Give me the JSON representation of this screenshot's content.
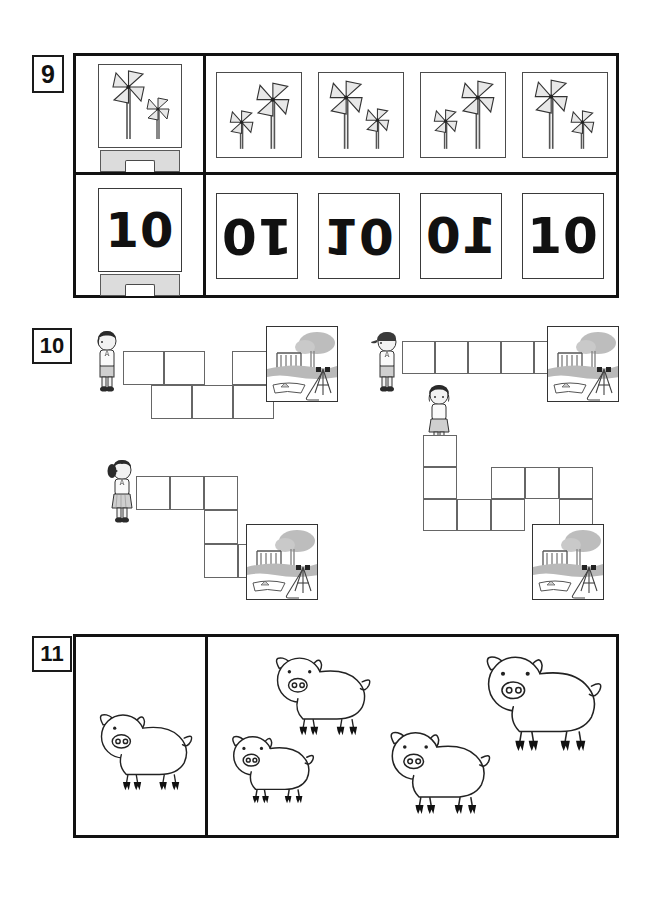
{
  "page": {
    "width": 656,
    "height": 907,
    "background": "#ffffff",
    "type": "visual-discrimination-worksheet"
  },
  "exercises": [
    {
      "number": "9",
      "kind": "match-the-same",
      "rows": [
        {
          "row_label": "pinwheels",
          "prompt": {
            "content": "two-pinwheels-large-left-small-right",
            "description": "reference card on a stand showing a large pinwheel on the left and a smaller pinwheel on the right"
          },
          "options": [
            {
              "index": 1,
              "content": "small-pinwheel-left-large-pinwheel-right",
              "transform": "mirrored"
            },
            {
              "index": 2,
              "content": "large-pinwheel-left-small-pinwheel-right",
              "transform": "same"
            },
            {
              "index": 3,
              "content": "small-pinwheel-left-large-pinwheel-right",
              "transform": "mirrored-variant"
            },
            {
              "index": 4,
              "content": "large-pinwheel-left-small-pinwheel-right",
              "transform": "same-variant"
            }
          ]
        },
        {
          "row_label": "numbers",
          "prompt": {
            "content": "10",
            "description": "reference card on a stand showing the number 10"
          },
          "options": [
            {
              "index": 1,
              "content": "10",
              "transform": "rotated-180",
              "glyph": "01"
            },
            {
              "index": 2,
              "content": "10",
              "transform": "mirrored-vertical",
              "glyph": "0Г"
            },
            {
              "index": 3,
              "content": "10",
              "transform": "mirrored-horizontal",
              "glyph": "Г0"
            },
            {
              "index": 4,
              "content": "10",
              "transform": "upright",
              "glyph": "10"
            }
          ]
        }
      ]
    },
    {
      "number": "10",
      "kind": "count-the-path-squares",
      "puzzles": [
        {
          "id": "top-left",
          "child": {
            "figure": "boy-short-dark-hair",
            "hat": false
          },
          "destination": "playground-photo",
          "path_cells": 7,
          "path_shape": "staircase-up-down-up"
        },
        {
          "id": "top-right",
          "child": {
            "figure": "boy-with-cap",
            "hat": true
          },
          "destination": "playground-photo",
          "path_cells": 5,
          "path_shape": "straight-horizontal"
        },
        {
          "id": "bottom-left",
          "child": {
            "figure": "girl-ponytail-skirt",
            "hat": false
          },
          "destination": "playground-photo",
          "path_cells": 6,
          "path_shape": "L-shape-right-then-down"
        },
        {
          "id": "bottom-right",
          "child": {
            "figure": "girl-short-dark-hair-skirt",
            "hat": false
          },
          "destination": "playground-photo",
          "path_cells": 9,
          "path_shape": "down-then-right-zigzag"
        }
      ]
    },
    {
      "number": "11",
      "kind": "find-the-same-size",
      "reference": {
        "animal": "pig",
        "size_label": "reference",
        "scale": 1.0
      },
      "options": [
        {
          "index": 1,
          "animal": "pig",
          "scale": 1.0,
          "position": "top-left"
        },
        {
          "index": 2,
          "animal": "pig",
          "scale": 1.22,
          "position": "top-right"
        },
        {
          "index": 3,
          "animal": "pig",
          "scale": 0.86,
          "position": "bottom-left"
        },
        {
          "index": 4,
          "animal": "pig",
          "scale": 1.06,
          "position": "bottom-right"
        }
      ]
    }
  ],
  "colors": {
    "ink": "#111111",
    "frame": "#111111",
    "cell_stroke": "#666666",
    "card_stroke": "#4c4c4c",
    "stand_fill": "#dcdcdc",
    "pinwheel_fill": "#e8e8e8",
    "photo_sky": "#c9c9c9",
    "skin": "#f0f0f0",
    "hair": "#2a2a2a",
    "paper": "#ffffff"
  }
}
